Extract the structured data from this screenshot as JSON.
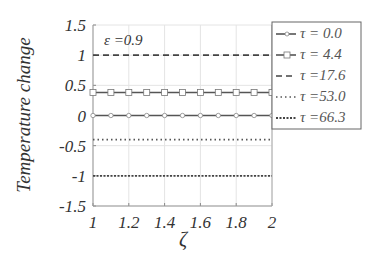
{
  "chart_data": {
    "type": "line",
    "title": "",
    "xlabel": "ζ",
    "ylabel": "Temperature change",
    "xlim": [
      1,
      2
    ],
    "ylim": [
      -1.5,
      1.5
    ],
    "grid": true,
    "x_ticks": [
      "1",
      "1.2",
      "1.4",
      "1.6",
      "1.8",
      "2"
    ],
    "y_ticks": [
      "1.5",
      "1",
      "0.5",
      "0",
      "-0.5",
      "-1",
      "-1.5"
    ],
    "annotation": "ε =0.9",
    "legend_position": "upper right (outside plot edge)",
    "x": [
      1,
      1.1,
      1.2,
      1.3,
      1.4,
      1.5,
      1.6,
      1.7,
      1.8,
      1.9,
      2
    ],
    "series": [
      {
        "name": "τ =  0.0",
        "style": "solid-circle",
        "values": [
          0,
          0,
          0,
          0,
          0,
          0,
          0,
          0,
          0,
          0,
          0
        ]
      },
      {
        "name": "τ =  4.4",
        "style": "solid-square",
        "values": [
          0.38,
          0.38,
          0.38,
          0.38,
          0.38,
          0.38,
          0.38,
          0.38,
          0.38,
          0.38,
          0.38
        ]
      },
      {
        "name": "τ =17.6",
        "style": "dashed",
        "values": [
          1,
          1,
          1,
          1,
          1,
          1,
          1,
          1,
          1,
          1,
          1
        ]
      },
      {
        "name": "τ =53.0",
        "style": "dotted",
        "values": [
          -0.4,
          -0.4,
          -0.4,
          -0.4,
          -0.4,
          -0.4,
          -0.4,
          -0.4,
          -0.4,
          -0.4,
          -0.4
        ]
      },
      {
        "name": "τ =66.3",
        "style": "dense-dotted",
        "values": [
          -1,
          -1,
          -1,
          -1,
          -1,
          -1,
          -1,
          -1,
          -1,
          -1,
          -1
        ]
      }
    ]
  }
}
